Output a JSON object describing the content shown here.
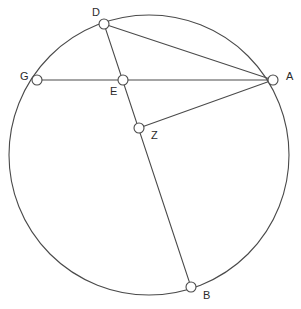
{
  "diagram": {
    "background_color": "#ffffff",
    "stroke_color": "#4a4a4a",
    "label_color": "#2b2b2b",
    "marker_fill": "#ffffff",
    "canvas": {
      "width": 301,
      "height": 309
    },
    "circle": {
      "name": "main-circle",
      "center_x": 149,
      "center_y": 155,
      "radius": 140
    },
    "points": [
      {
        "id": "D",
        "label": "D",
        "x": 104,
        "y": 24,
        "radius": 5,
        "label_x": 92,
        "label_y": 13,
        "on_circle": true
      },
      {
        "id": "G",
        "label": "G",
        "x": 37,
        "y": 80,
        "radius": 5,
        "label_x": 20,
        "label_y": 77,
        "on_circle": true
      },
      {
        "id": "E",
        "label": "E",
        "x": 123,
        "y": 80,
        "radius": 5,
        "label_x": 110,
        "label_y": 92,
        "on_circle": false
      },
      {
        "id": "A",
        "label": "A",
        "x": 273,
        "y": 80,
        "radius": 5,
        "label_x": 286,
        "label_y": 77,
        "on_circle": true
      },
      {
        "id": "Z",
        "label": "Z",
        "x": 139,
        "y": 128,
        "radius": 5,
        "label_x": 151,
        "label_y": 136,
        "on_circle": false
      },
      {
        "id": "B",
        "label": "B",
        "x": 191,
        "y": 287,
        "radius": 5,
        "label_x": 203,
        "label_y": 296,
        "on_circle": true
      }
    ],
    "segments": [
      {
        "name": "segment-G-A",
        "from": "G",
        "to": "A",
        "x1": 37,
        "y1": 80,
        "x2": 273,
        "y2": 80
      },
      {
        "name": "segment-D-A",
        "from": "D",
        "to": "A",
        "x1": 104,
        "y1": 24,
        "x2": 273,
        "y2": 80
      },
      {
        "name": "segment-D-B",
        "from": "D",
        "to": "B",
        "x1": 104,
        "y1": 24,
        "x2": 191,
        "y2": 287
      },
      {
        "name": "segment-Z-A",
        "from": "Z",
        "to": "A",
        "x1": 139,
        "y1": 128,
        "x2": 273,
        "y2": 80
      }
    ]
  }
}
